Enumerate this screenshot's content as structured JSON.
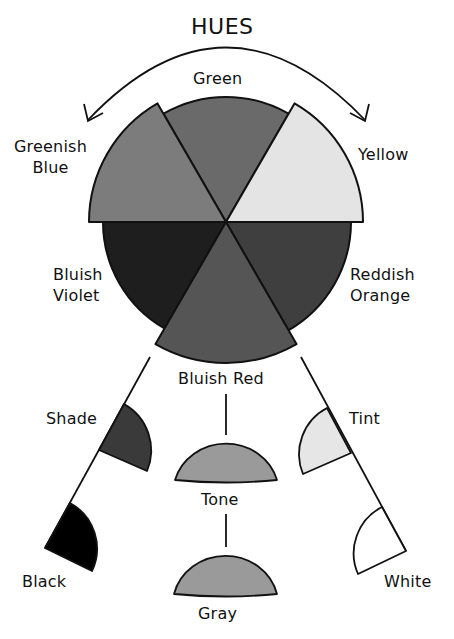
{
  "title": "HUES",
  "wheel": {
    "segments": [
      {
        "id": "green",
        "label": "Green",
        "color": "#6a6a6a"
      },
      {
        "id": "yellow",
        "label": "Yellow",
        "color": "#e4e4e4"
      },
      {
        "id": "reddish-orange",
        "label_line1": "Reddish",
        "label_line2": "Orange",
        "color": "#3f3f3f"
      },
      {
        "id": "bluish-red",
        "label": "Bluish Red",
        "color": "#555555"
      },
      {
        "id": "bluish-violet",
        "label_line1": "Bluish",
        "label_line2": "Violet",
        "color": "#1e1e1e"
      },
      {
        "id": "greenish-blue",
        "label_line1": "Greenish",
        "label_line2": "Blue",
        "color": "#7c7c7c"
      }
    ]
  },
  "derivations": {
    "shade": {
      "label": "Shade",
      "color": "#3a3a3a"
    },
    "black": {
      "label": "Black",
      "color": "#000000"
    },
    "tone": {
      "label": "Tone",
      "color": "#9a9a9a"
    },
    "gray": {
      "label": "Gray",
      "color": "#9a9a9a"
    },
    "tint": {
      "label": "Tint",
      "color": "#e6e6e6"
    },
    "white": {
      "label": "White",
      "color": "#ffffff"
    }
  }
}
